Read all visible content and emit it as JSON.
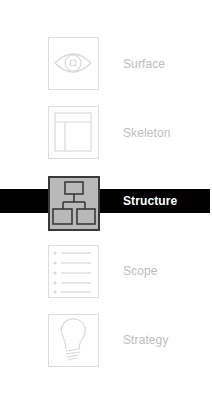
{
  "diagram": {
    "type": "layered-planes",
    "active_plane": "Structure",
    "colors": {
      "inactive_text": "#bdbdbd",
      "inactive_border": "#dcdcdc",
      "active_bar": "#000000",
      "active_text": "#ffffff",
      "active_icon_bg": "#b9b9b9",
      "active_icon_stroke": "#3a3a3a"
    },
    "planes": [
      {
        "label": "Surface",
        "icon": "eye-icon",
        "active": false
      },
      {
        "label": "Skeleton",
        "icon": "wireframe-layout-icon",
        "active": false
      },
      {
        "label": "Structure",
        "icon": "hierarchy-tree-icon",
        "active": true
      },
      {
        "label": "Scope",
        "icon": "bullet-list-icon",
        "active": false
      },
      {
        "label": "Strategy",
        "icon": "lightbulb-icon",
        "active": false
      }
    ]
  }
}
